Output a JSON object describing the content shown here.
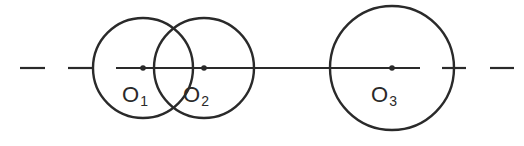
{
  "diagram": {
    "line_color": "#2a2a2a",
    "background": "#ffffff",
    "axis_y": 68,
    "circles": [
      {
        "id": "O1",
        "label": "O",
        "subscript": "1",
        "cx": 143,
        "cy": 68,
        "r": 50
      },
      {
        "id": "O2",
        "label": "O",
        "subscript": "2",
        "cx": 204,
        "cy": 68,
        "r": 50
      },
      {
        "id": "O3",
        "label": "O",
        "subscript": "3",
        "cx": 392,
        "cy": 68,
        "r": 62
      }
    ],
    "line_segments": [
      {
        "x1": 20,
        "x2": 45,
        "style": "dash"
      },
      {
        "x1": 68,
        "x2": 93,
        "style": "dash"
      },
      {
        "x1": 116,
        "x2": 420,
        "style": "solid"
      },
      {
        "x1": 442,
        "x2": 466,
        "style": "dash"
      },
      {
        "x1": 490,
        "x2": 514,
        "style": "dash"
      }
    ]
  }
}
